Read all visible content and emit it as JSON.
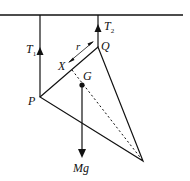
{
  "diagram": {
    "type": "physics-free-body",
    "colors": {
      "stroke": "#111111",
      "background": "#ffffff"
    },
    "labels": {
      "T1": {
        "main": "T",
        "sub": "1"
      },
      "T2": {
        "main": "T",
        "sub": "2"
      },
      "Q": "Q",
      "P": "P",
      "X": "X",
      "G": "G",
      "r": "r",
      "Mg": "Mg"
    },
    "points": {
      "ceiling_left": [
        0,
        15
      ],
      "ceiling_right": [
        183,
        15
      ],
      "P": [
        40,
        97
      ],
      "Q": [
        98,
        47
      ],
      "bottom_vertex": [
        143,
        161
      ],
      "G": [
        82,
        85
      ],
      "X": [
        72,
        64
      ],
      "Mg_arrow_tip": [
        82,
        158
      ]
    }
  }
}
